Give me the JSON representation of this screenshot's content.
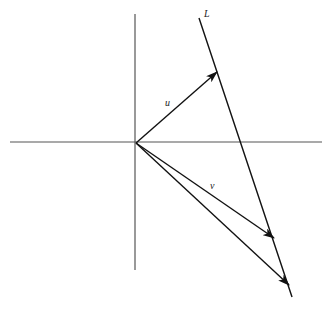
{
  "diagram": {
    "labels": {
      "line": "L",
      "vector_u": "u",
      "vector_v": "v"
    },
    "origin": [
      136,
      143
    ],
    "axes": {
      "x": {
        "from": [
          10,
          142
        ],
        "to": [
          322,
          142
        ],
        "color": "#555555"
      },
      "y": {
        "from": [
          135,
          14
        ],
        "to": [
          135,
          270
        ],
        "color": "#555555"
      }
    },
    "line_L": {
      "from": [
        199,
        18
      ],
      "to": [
        292,
        297
      ],
      "color": "#111111"
    },
    "vectors": [
      {
        "name": "u",
        "from": [
          136,
          143
        ],
        "to": [
          217,
          72
        ]
      },
      {
        "name": "v",
        "from": [
          136,
          143
        ],
        "to": [
          274,
          238
        ]
      },
      {
        "name": "w",
        "from": [
          136,
          143
        ],
        "to": [
          289,
          285
        ]
      }
    ]
  }
}
